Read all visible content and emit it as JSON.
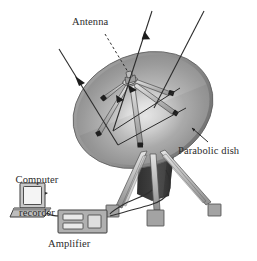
{
  "diagram": {
    "labels": {
      "antenna": "Antenna",
      "parabolic_dish": "Parabolic dish",
      "computer_recorder_line1": "Computer",
      "computer_recorder_line2": "recorder",
      "amplifier": "Amplifier"
    },
    "components": [
      {
        "name": "parabolic-dish",
        "label": "Parabolic dish"
      },
      {
        "name": "feed-antenna",
        "label": "Antenna"
      },
      {
        "name": "tripod-mount",
        "label": ""
      },
      {
        "name": "amplifier-box",
        "label": "Amplifier"
      },
      {
        "name": "computer-recorder",
        "label": "Computer recorder"
      },
      {
        "name": "signal-cable",
        "label": ""
      }
    ],
    "incoming_rays": [
      {
        "name": "incoming-ray-left",
        "direction": "down-right"
      },
      {
        "name": "incoming-ray-right",
        "direction": "down-left"
      }
    ],
    "colors": {
      "background": "#ffffff",
      "dish_face": "#9a9a9a",
      "dish_highlight": "#ededed",
      "dish_rim_dark": "#6e6e6e",
      "mount_dark": "#3d3d3d",
      "strut": "#b9b9b9",
      "foot": "#9f9f9f",
      "line": "#3a3a3a",
      "text": "#2b2b2b",
      "device_body": "#b2b2b2",
      "device_dark": "#6b6b6b"
    }
  }
}
